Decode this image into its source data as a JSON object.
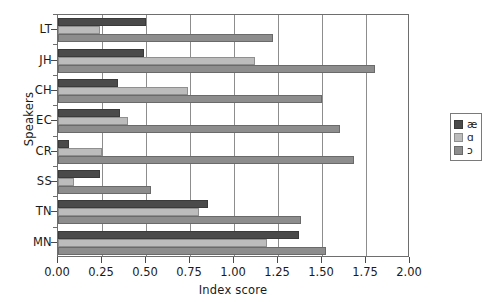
{
  "chart_data": {
    "type": "bar",
    "orientation": "horizontal",
    "title": "",
    "xlabel": "Index score",
    "ylabel": "Speakers",
    "xlim": [
      0.0,
      2.0
    ],
    "xticks": [
      "0.00",
      "0.25",
      "0.50",
      "0.75",
      "1.00",
      "1.25",
      "1.50",
      "1.75",
      "2.00"
    ],
    "xtick_values": [
      0.0,
      0.25,
      0.5,
      0.75,
      1.0,
      1.25,
      1.5,
      1.75,
      2.0
    ],
    "grid": "vertical",
    "legend_position": "right",
    "categories": [
      "LT",
      "JH",
      "CH",
      "EC",
      "CR",
      "SS",
      "TN",
      "MN"
    ],
    "series": [
      {
        "name": "æ",
        "color": "#4a4a4a",
        "values": [
          0.5,
          0.49,
          0.34,
          0.35,
          0.06,
          0.24,
          0.85,
          1.37
        ]
      },
      {
        "name": "ɑ",
        "color": "#bcbcbc",
        "values": [
          0.24,
          1.12,
          0.74,
          0.4,
          0.25,
          0.09,
          0.8,
          1.19
        ]
      },
      {
        "name": "ɔ",
        "color": "#8d8d8d",
        "values": [
          1.22,
          1.8,
          1.5,
          1.6,
          1.68,
          0.53,
          1.38,
          1.52
        ]
      }
    ]
  }
}
